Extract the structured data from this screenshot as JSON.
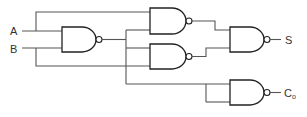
{
  "diagram": {
    "inputs": [
      {
        "id": "A",
        "label": "A"
      },
      {
        "id": "B",
        "label": "B"
      }
    ],
    "outputs": [
      {
        "id": "S",
        "label": "S"
      },
      {
        "id": "Co",
        "label": "C",
        "subscript": "o"
      }
    ],
    "gates": [
      {
        "id": "G1",
        "type": "NAND",
        "inputs": [
          "A",
          "B"
        ]
      },
      {
        "id": "G2",
        "type": "NAND",
        "inputs": [
          "A",
          "G1"
        ]
      },
      {
        "id": "G3",
        "type": "NAND",
        "inputs": [
          "G1",
          "B"
        ]
      },
      {
        "id": "G4",
        "type": "NAND",
        "inputs": [
          "G2",
          "G3"
        ],
        "output": "S"
      },
      {
        "id": "G5",
        "type": "NAND",
        "inputs": [
          "G1",
          "G1"
        ],
        "output": "Co"
      }
    ],
    "colors": {
      "line": "#555555",
      "gate": "#222222",
      "text": "#333333"
    }
  }
}
